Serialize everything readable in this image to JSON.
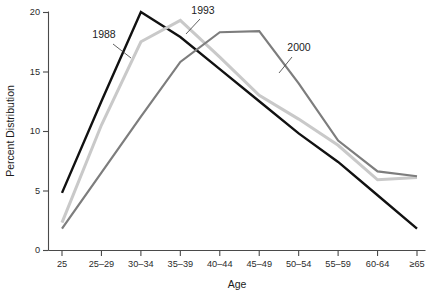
{
  "chart_data": {
    "type": "line",
    "title": "",
    "xlabel": "Age",
    "ylabel": "Percent Distribution",
    "categories": [
      "25",
      "25–29",
      "30–34",
      "35–39",
      "40–44",
      "45–49",
      "50–54",
      "55–59",
      "60-64",
      "≥65"
    ],
    "ylim": [
      0,
      20
    ],
    "yticks": [
      0,
      5,
      10,
      15,
      20
    ],
    "ytick_labels": [
      "0",
      "5",
      "10",
      "15",
      "20"
    ],
    "grid": false,
    "legend": "annotations-on-curves",
    "series": [
      {
        "name": "1988",
        "color": "#111111",
        "width": 2.4,
        "values": [
          4.8,
          12.5,
          20.0,
          17.9,
          15.2,
          12.5,
          9.8,
          7.4,
          4.6,
          1.8
        ]
      },
      {
        "name": "1993",
        "color": "#c9c9c9",
        "width": 3.0,
        "values": [
          2.3,
          10.5,
          17.5,
          19.3,
          16.2,
          13.0,
          11.0,
          8.8,
          5.9,
          6.1
        ]
      },
      {
        "name": "2000",
        "color": "#7d7d7d",
        "width": 2.2,
        "values": [
          1.8,
          6.5,
          11.2,
          15.8,
          18.3,
          18.4,
          14.0,
          9.2,
          6.6,
          6.2
        ]
      }
    ],
    "annotations": [
      {
        "label": "1988",
        "x": 104,
        "y": 38,
        "leader": "M 113 44 L 131 58"
      },
      {
        "label": "1993",
        "x": 203,
        "y": 14,
        "leader": "M 200 19 L 186 34"
      },
      {
        "label": "2000",
        "x": 299,
        "y": 51,
        "leader": "M 292 57 L 279 73"
      }
    ]
  },
  "axis": {
    "y_label": "Percent Distribution",
    "x_label": "Age"
  }
}
